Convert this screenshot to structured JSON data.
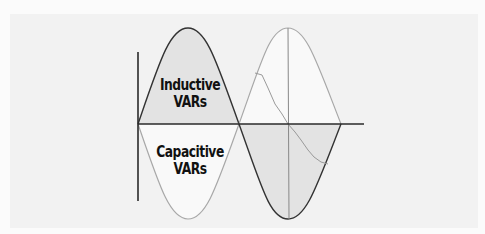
{
  "diagram": {
    "title": "",
    "labels": {
      "inductive_line1": "Inductive",
      "inductive_line2": "VARs",
      "capacitive_line1": "Capacitive",
      "capacitive_line2": "VARs"
    },
    "colors": {
      "background": "#f2f2f2",
      "inductive_fill": "#e3e3e3",
      "capacitive_fill": "#f9f9f9",
      "dark_line": "#333333",
      "light_line": "#a8a8a8",
      "axis": "#2a2a2a"
    }
  }
}
